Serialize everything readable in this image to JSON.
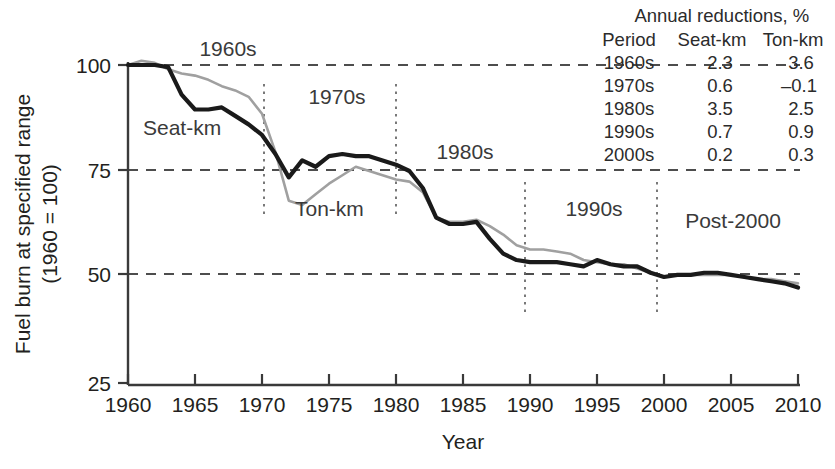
{
  "chart_data": {
    "type": "line",
    "title": "",
    "xlabel": "Year",
    "ylabel": "Fuel burn at specified range (1960 = 100)",
    "ylabel_line1": "Fuel burn at specified range",
    "ylabel_line2": "(1960 = 100)",
    "xlim": [
      1960,
      2010
    ],
    "ylim": [
      25,
      100
    ],
    "xticks": [
      1960,
      1965,
      1970,
      1975,
      1980,
      1985,
      1990,
      1995,
      2000,
      2005,
      2010
    ],
    "yticks": [
      25,
      50,
      75,
      100
    ],
    "grid": "horizontal-dashed at 50, 75, 100",
    "legend": "inline-labels",
    "x": [
      1960,
      1961,
      1962,
      1963,
      1964,
      1965,
      1966,
      1967,
      1968,
      1969,
      1970,
      1971,
      1972,
      1973,
      1974,
      1975,
      1976,
      1977,
      1978,
      1979,
      1980,
      1981,
      1982,
      1983,
      1984,
      1985,
      1986,
      1987,
      1988,
      1989,
      1990,
      1991,
      1992,
      1993,
      1994,
      1995,
      1996,
      1997,
      1998,
      1999,
      2000,
      2001,
      2002,
      2003,
      2004,
      2005,
      2006,
      2007,
      2008,
      2009,
      2010
    ],
    "series": [
      {
        "name": "Seat-km",
        "color": "#1a1a1a",
        "values": [
          100,
          100,
          100,
          99.5,
          93,
          89.5,
          89.5,
          90,
          88,
          86,
          83.5,
          79,
          73.5,
          77.5,
          76,
          78.5,
          79,
          78.5,
          78.5,
          77.5,
          76.5,
          75,
          71,
          64,
          62.5,
          62.5,
          63,
          59,
          55.5,
          54,
          53.5,
          53.5,
          53.5,
          53,
          52.5,
          54,
          53,
          52.5,
          52.5,
          51,
          50,
          50.5,
          50.5,
          51,
          51,
          50.5,
          50,
          49.5,
          49,
          48.5,
          47.5
        ]
      },
      {
        "name": "Ton-km",
        "color": "#a0a0a0",
        "values": [
          100,
          101,
          100.5,
          99,
          98,
          97.5,
          96.5,
          95,
          94,
          92.5,
          88.5,
          79.5,
          68,
          67,
          69.5,
          72,
          74,
          76,
          75,
          74,
          73,
          72.5,
          70,
          64,
          63,
          63,
          63.5,
          62,
          60,
          57.5,
          56.5,
          56.5,
          56,
          55.5,
          54,
          53.5,
          53,
          53,
          52,
          51,
          50,
          50.5,
          50.5,
          50.5,
          50.5,
          50.5,
          50,
          49.5,
          49.5,
          49,
          48.5
        ]
      }
    ],
    "period_dividers": [
      1970.5,
      1980.5,
      1990.5,
      2000.5
    ],
    "period_annotations": [
      {
        "label": "1960s",
        "x": 1965.0,
        "y": 103.5
      },
      {
        "label": "1970s",
        "x": 1975.5,
        "y": 93.0
      },
      {
        "label": "1980s",
        "x": 1985.0,
        "y": 80.5
      },
      {
        "label": "1990s",
        "x": 1995.0,
        "y": 68.0
      },
      {
        "label": "Post-2000",
        "x": 2005.5,
        "y": 66.0
      }
    ],
    "series_annotations": [
      {
        "label": "Seat-km",
        "x": 1963.5,
        "y": 84.0
      },
      {
        "label": "Ton-km",
        "x": 1974.0,
        "y": 66.5
      }
    ]
  },
  "table": {
    "title": "Annual reductions,  %",
    "title_main": "Annual reductions,",
    "title_unit": "%",
    "columns": [
      "Period",
      "Seat-km",
      "Ton-km"
    ],
    "rows": [
      {
        "period": "1960s",
        "seat_km": "2.3",
        "ton_km": "3.6"
      },
      {
        "period": "1970s",
        "seat_km": "0.6",
        "ton_km": "–0.1"
      },
      {
        "period": "1980s",
        "seat_km": "3.5",
        "ton_km": "2.5"
      },
      {
        "period": "1990s",
        "seat_km": "0.7",
        "ton_km": "0.9"
      },
      {
        "period": "2000s",
        "seat_km": "0.2",
        "ton_km": "0.3"
      }
    ]
  },
  "axis": {
    "x_title": "Year",
    "y_title_line1": "Fuel burn at specified range",
    "y_title_line2": "(1960 = 100)",
    "x_tick_labels": [
      "1960",
      "1965",
      "1970",
      "1975",
      "1980",
      "1985",
      "1990",
      "1995",
      "2000",
      "2005",
      "2010"
    ],
    "y_tick_labels": [
      "25",
      "50",
      "75",
      "100"
    ]
  },
  "colors": {
    "seat_km": "#1a1a1a",
    "ton_km": "#a0a0a0",
    "axis": "#3a3a3a",
    "grid": "#4d4d4d",
    "divider": "#6b6b6b",
    "text": "#231f20",
    "background": "#ffffff"
  }
}
